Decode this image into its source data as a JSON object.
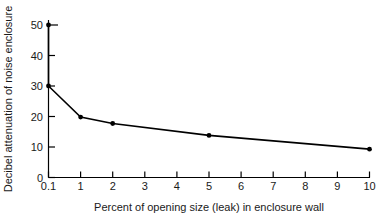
{
  "chart_data": {
    "type": "line",
    "title": "",
    "subtitle": "",
    "xlabel": "Percent of opening size (leak) in enclosure wall",
    "ylabel": "Decibel attenuation of noise enclosure",
    "x_tick_labels": [
      "0.1",
      "1",
      "2",
      "3",
      "4",
      "5",
      "6",
      "7",
      "8",
      "9",
      "10"
    ],
    "y_tick_labels": [
      "0",
      "10",
      "20",
      "30",
      "40",
      "50"
    ],
    "y_ticks": [
      0,
      10,
      20,
      30,
      40,
      50
    ],
    "ylim": [
      0,
      52
    ],
    "x_scale": "categorical-even-spacing",
    "grid": false,
    "legend": false,
    "legend_position": "none",
    "series": [
      {
        "name": "Decibel attenuation",
        "x": [
          "0.1",
          "0.1",
          "1",
          "2",
          "5",
          "10"
        ],
        "values": [
          50,
          30,
          19.8,
          17.7,
          13.8,
          9.3
        ],
        "marker": "filled-circle",
        "color": "#000000"
      }
    ],
    "annotations": []
  },
  "axis": {
    "x_title": "Percent of opening size (leak) in enclosure wall",
    "y_title": "Decibel attenuation of noise enclosure"
  },
  "ticks": {
    "x": [
      {
        "label": "0.1"
      },
      {
        "label": "1"
      },
      {
        "label": "2"
      },
      {
        "label": "3"
      },
      {
        "label": "4"
      },
      {
        "label": "5"
      },
      {
        "label": "6"
      },
      {
        "label": "7"
      },
      {
        "label": "8"
      },
      {
        "label": "9"
      },
      {
        "label": "10"
      }
    ],
    "y": [
      {
        "label": "0"
      },
      {
        "label": "10"
      },
      {
        "label": "20"
      },
      {
        "label": "30"
      },
      {
        "label": "40"
      },
      {
        "label": "50"
      }
    ]
  },
  "colors": {
    "line": "#000000",
    "axis": "#000000",
    "marker": "#000000",
    "background": "#ffffff",
    "text": "#1a1a1a"
  }
}
